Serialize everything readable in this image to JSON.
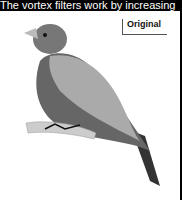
{
  "caption": "The vortex filters work by increasing",
  "panel": {
    "label": "Original",
    "image": "bird-illustration-grayscale"
  }
}
